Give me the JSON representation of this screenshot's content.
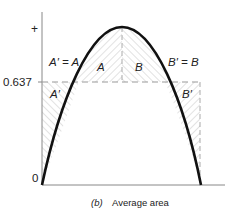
{
  "diagram": {
    "y_axis": {
      "top_label": "+",
      "mid_label": "0.637",
      "zero_label": "0"
    },
    "regions": {
      "a_label": "A",
      "b_label": "B",
      "a_prime_label": "A′",
      "b_prime_label": "B′",
      "a_eq": "A′ = A",
      "b_eq": "B′ = B"
    },
    "caption": {
      "part": "(b)",
      "text": "Average area"
    },
    "colors": {
      "curve": "#111111",
      "dashed": "#999999",
      "hatch": "#cfcfcf",
      "axis": "#888888"
    }
  }
}
